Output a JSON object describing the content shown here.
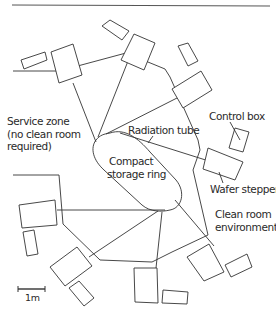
{
  "labels": {
    "service_zone": [
      "Service zone",
      "(no clean room",
      "required)"
    ],
    "radiation_tube": "Radiation tube",
    "control_box": "Control box",
    "compact_storage_ring": [
      "Compact",
      "storage ring"
    ],
    "wafer_stepper": "Wafer stepper",
    "clean_room": [
      "Clean room",
      "environment"
    ],
    "scale_bar": "1m"
  },
  "colors": {
    "line": "#333333",
    "text": "#2a2a2a",
    "background": "#ffffff"
  }
}
